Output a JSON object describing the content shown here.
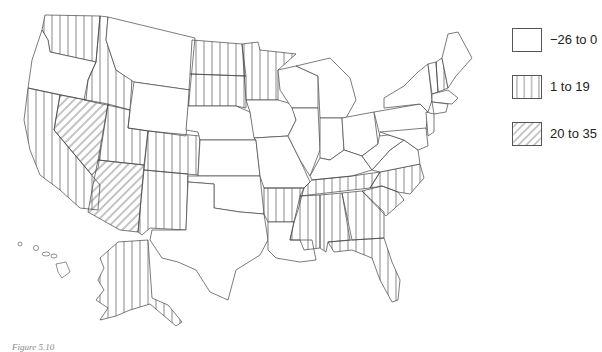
{
  "figure": {
    "caption_visible_fragment": "Figure 5.10"
  },
  "legend": {
    "items": [
      {
        "label": "−26 to 0",
        "pattern": "none"
      },
      {
        "label": "1 to 19",
        "pattern": "vertical-lines"
      },
      {
        "label": "20 to 35",
        "pattern": "diagonal-lines"
      }
    ]
  },
  "map": {
    "type": "choropleth",
    "region": "United States",
    "classes": {
      "-26 to 0": [
        "Oregon",
        "Montana",
        "Wyoming",
        "Nebraska",
        "Kansas",
        "Oklahoma",
        "Texas",
        "Louisiana",
        "Iowa",
        "Missouri",
        "Wisconsin",
        "Michigan",
        "Illinois",
        "Indiana",
        "Ohio",
        "Kentucky",
        "West Virginia",
        "Virginia",
        "Maryland",
        "Delaware",
        "New Jersey",
        "Pennsylvania",
        "New York",
        "Vermont",
        "Maine",
        "Massachusetts",
        "Connecticut",
        "Rhode Island",
        "Hawaii"
      ],
      "1 to 19": [
        "Washington",
        "Idaho",
        "California",
        "Utah",
        "Colorado",
        "New Mexico",
        "North Dakota",
        "South Dakota",
        "Minnesota",
        "Arkansas",
        "Tennessee",
        "Mississippi",
        "Alabama",
        "Georgia",
        "South Carolina",
        "North Carolina",
        "Florida",
        "New Hampshire",
        "Alaska"
      ],
      "20 to 35": [
        "Nevada",
        "Arizona"
      ]
    }
  }
}
